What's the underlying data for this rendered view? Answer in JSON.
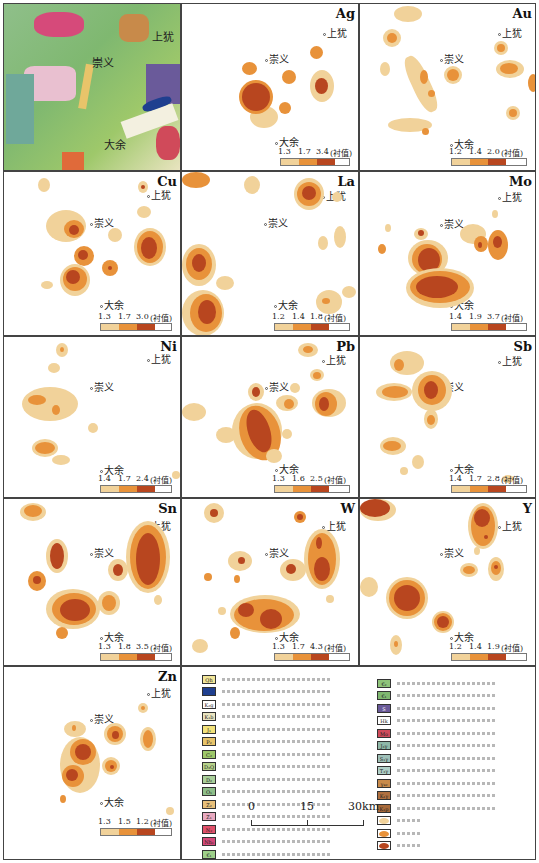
{
  "figure": {
    "towns": {
      "shangyou": "上犹",
      "chongyi": "崇义",
      "dayu": "大余"
    },
    "unit": "(衬值)"
  },
  "panels": [
    {
      "id": "geology",
      "label": ""
    },
    {
      "id": "Ag",
      "label": "Ag",
      "thresholds": [
        "1.3",
        "1.7",
        "3.4"
      ]
    },
    {
      "id": "Au",
      "label": "Au",
      "thresholds": [
        "1.2",
        "1.4",
        "2.0"
      ]
    },
    {
      "id": "Cu",
      "label": "Cu",
      "thresholds": [
        "1.3",
        "1.7",
        "3.0"
      ]
    },
    {
      "id": "La",
      "label": "La",
      "thresholds": [
        "1.2",
        "1.4",
        "1.8"
      ]
    },
    {
      "id": "Mo",
      "label": "Mo",
      "thresholds": [
        "1.4",
        "1.9",
        "3.7"
      ]
    },
    {
      "id": "Ni",
      "label": "Ni",
      "thresholds": [
        "1.4",
        "1.7",
        "2.4"
      ]
    },
    {
      "id": "Pb",
      "label": "Pb",
      "thresholds": [
        "1.3",
        "1.6",
        "2.5"
      ]
    },
    {
      "id": "Sb",
      "label": "Sb",
      "thresholds": [
        "1.4",
        "1.7",
        "2.8"
      ]
    },
    {
      "id": "Sn",
      "label": "Sn",
      "thresholds": [
        "1.3",
        "1.8",
        "3.5"
      ]
    },
    {
      "id": "W",
      "label": "W",
      "thresholds": [
        "1.3",
        "1.7",
        "4.3"
      ]
    },
    {
      "id": "Y",
      "label": "Y",
      "thresholds": [
        "1.2",
        "1.4",
        "1.9"
      ]
    },
    {
      "id": "Zn",
      "label": "Zn",
      "thresholds": [
        "1.3",
        "1.5",
        "1.2"
      ]
    }
  ],
  "colors": {
    "outer_zone": "#f1d29a",
    "middle_zone": "#e8923a",
    "inner_zone": "#b8461f"
  },
  "legend": {
    "left_column": [
      {
        "code": "Qh",
        "color": "#f3e79a"
      },
      {
        "code": "",
        "color": "#1f3f8f"
      },
      {
        "code": "K₂g",
        "color": "#ffffff"
      },
      {
        "code": "K₁b",
        "color": "#e9e4c0"
      },
      {
        "code": "J₁",
        "color": "#f2e27a"
      },
      {
        "code": "P₂",
        "color": "#e8c46a"
      },
      {
        "code": "C₂",
        "color": "#9ec86a"
      },
      {
        "code": "D₃Q",
        "color": "#b7d28a"
      },
      {
        "code": "D₂",
        "color": "#a9cf9a"
      },
      {
        "code": "O₁",
        "color": "#8fbf8a"
      },
      {
        "code": "Z₂",
        "color": "#e8c07a"
      },
      {
        "code": "Z₁",
        "color": "#e9a9c0"
      },
      {
        "code": "N₂",
        "color": "#e0506a"
      },
      {
        "code": "Nh₁",
        "color": "#d64a7a"
      },
      {
        "code": "€₁",
        "color": "#9ed08a"
      }
    ],
    "right_column": [
      {
        "code": "€₂",
        "color": "#8fc47a"
      },
      {
        "code": "€₁",
        "color": "#7fb870"
      },
      {
        "code": "S",
        "color": "#6a5a9a"
      },
      {
        "code": "Hk",
        "color": "#ffffff"
      },
      {
        "code": "Mo",
        "color": "#d04a5a"
      },
      {
        "code": "J₃γ",
        "color": "#8fb8a8"
      },
      {
        "code": "S₁γ",
        "color": "#9fc0b8"
      },
      {
        "code": "T₃γ",
        "color": "#b0d0c8"
      },
      {
        "code": "γ₄₂",
        "color": "#c88a4a"
      },
      {
        "code": "K₁γ",
        "color": "#b07040"
      },
      {
        "code": "K₁p",
        "color": "#a86a3a"
      },
      {
        "code": "",
        "color": "#f1d29a",
        "kind": "outer-zone"
      },
      {
        "code": "",
        "color": "#e8923a",
        "kind": "middle-zone"
      },
      {
        "code": "",
        "color": "#b8461f",
        "kind": "inner-zone"
      }
    ]
  },
  "scale_bar": {
    "ticks": [
      "0",
      "15",
      "30km"
    ]
  }
}
